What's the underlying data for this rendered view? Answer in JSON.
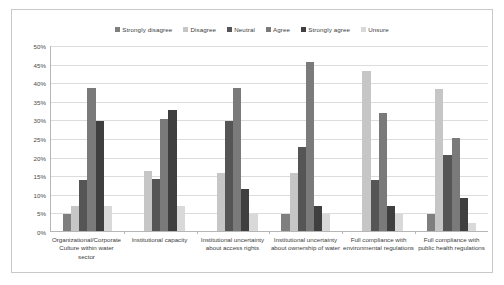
{
  "chart_data": {
    "type": "bar",
    "title": "",
    "subtitle": "",
    "xlabel": "",
    "ylabel": "",
    "ylim": [
      0,
      50
    ],
    "y_tick_step": 5,
    "y_ticks": [
      "0%",
      "5%",
      "10%",
      "15%",
      "20%",
      "25%",
      "30%",
      "35%",
      "40%",
      "45%",
      "50%"
    ],
    "grid": true,
    "legend_position": "top-center",
    "value_unit": "%",
    "categories": [
      "Organizational/Corporate Culture within water sector",
      "Institutional capacity",
      "Institutional uncertainty about access rights",
      "Institutional uncertainty about ownership of water",
      "Full compliance with environmental regulations",
      "Full compliance with public health regulations"
    ],
    "category_lines": [
      [
        "Organizational/Corporate",
        "Culture within water",
        "sector"
      ],
      [
        "Institutional capacity"
      ],
      [
        "Institutional uncertainty",
        "about access rights"
      ],
      [
        "Institutional uncertainty",
        "about ownership of water"
      ],
      [
        "Full compliance with",
        "environmental regulations"
      ],
      [
        "Full compliance with",
        "public health regulations"
      ]
    ],
    "series": [
      {
        "name": "Strongly disagree",
        "color": "#7f7f7f",
        "values": [
          4.5,
          0,
          0,
          4.5,
          0,
          4.5
        ]
      },
      {
        "name": "Disagree",
        "color": "#c6c6c6",
        "values": [
          6.8,
          16.2,
          15.7,
          15.7,
          43.0,
          38.3
        ]
      },
      {
        "name": "Neutral",
        "color": "#555555",
        "values": [
          13.6,
          14.0,
          29.5,
          22.7,
          13.6,
          20.3
        ]
      },
      {
        "name": "Agree",
        "color": "#7a7a7a",
        "values": [
          38.5,
          30.0,
          38.5,
          45.4,
          31.6,
          25.0
        ]
      },
      {
        "name": "Strongly agree",
        "color": "#3f3f3f",
        "values": [
          29.5,
          32.4,
          11.3,
          6.8,
          6.8,
          9.0
        ]
      },
      {
        "name": "Unsure",
        "color": "#d9d9d9",
        "values": [
          6.8,
          6.8,
          4.5,
          4.5,
          4.5,
          2.2
        ]
      }
    ]
  },
  "frame": {
    "border_color": "#c9c9c9",
    "background": "#ffffff"
  }
}
